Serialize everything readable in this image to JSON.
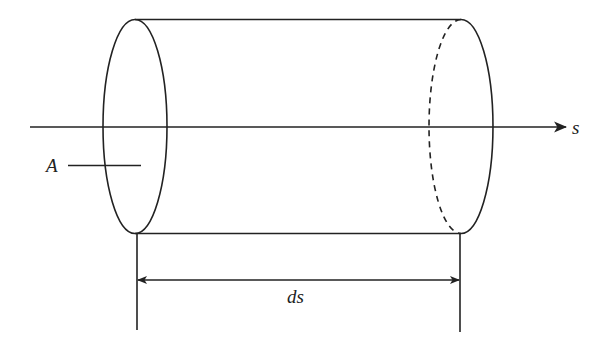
{
  "diagram": {
    "type": "cylindrical fluid element along streamline",
    "labels": {
      "area": "A",
      "axis": "s",
      "length": "ds"
    },
    "colors": {
      "stroke": "#222222",
      "background": "#ffffff"
    },
    "geometry": {
      "left_cap": {
        "cx": 135,
        "cy": 126,
        "rx": 32,
        "ry": 107,
        "style": "solid"
      },
      "right_cap": {
        "cx": 461,
        "cy": 126,
        "rx": 32,
        "ry": 107,
        "front_style": "solid",
        "back_style": "dashed"
      },
      "top_edge": {
        "x1": 135,
        "x2": 461,
        "y": 19
      },
      "bottom_edge": {
        "x1": 135,
        "x2": 461,
        "y": 233
      },
      "axis": {
        "x1": 30,
        "x2": 566,
        "y": 127,
        "arrow": "end"
      },
      "dimension": {
        "x1": 137,
        "x2": 460,
        "y": 280,
        "arrow": "both"
      },
      "extension_lines": [
        {
          "x": 137,
          "y1": 233,
          "y2": 330
        },
        {
          "x": 460,
          "y1": 233,
          "y2": 332
        }
      ],
      "area_leader": {
        "x1": 68,
        "x2": 141,
        "y": 165
      }
    }
  }
}
